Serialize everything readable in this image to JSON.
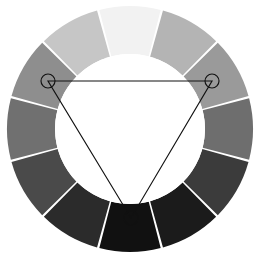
{
  "figure": {
    "background_color": "#ffffff"
  },
  "chart_data": {
    "type": "pie",
    "subtitle": "",
    "xlabel": "",
    "ylabel": "",
    "legend_position": "none",
    "grid": false,
    "geometry": {
      "center_x": 130,
      "center_y": 129,
      "outer_radius": 123,
      "inner_radius": 75,
      "segment_count": 12,
      "segment_arc_degrees": 30,
      "start_angle_degrees": -105,
      "gap_degrees": 1.1
    },
    "categories": [
      "segment-1-top",
      "segment-2",
      "segment-3",
      "segment-4",
      "segment-5",
      "segment-6-bottom",
      "segment-7",
      "segment-8",
      "segment-9",
      "segment-10",
      "segment-11",
      "segment-12"
    ],
    "values": [
      30,
      30,
      30,
      30,
      30,
      30,
      30,
      30,
      30,
      30,
      30,
      30
    ],
    "colors": [
      "#f2f2f2",
      "#b4b4b4",
      "#9a9a9a",
      "#6e6e6e",
      "#3b3b3b",
      "#1b1b1b",
      "#111111",
      "#2b2b2b",
      "#4a4a4a",
      "#707070",
      "#8e8e8e",
      "#c6c6c6"
    ],
    "segment_labels": [
      "lightest",
      "light gray",
      "mid light gray",
      "mid gray",
      "dark gray",
      "very dark gray",
      "near black",
      "very dark gray",
      "dark gray",
      "mid gray",
      "mid light gray",
      "light gray"
    ],
    "annotations": {
      "shape": "triangle",
      "shape_label": "triad harmony triangle",
      "stroke_color": "#111111",
      "vertices": [
        {
          "name": "vertex-left",
          "x": 48,
          "y": 81,
          "marker": "circle",
          "marker_radius": 7
        },
        {
          "name": "vertex-right",
          "x": 212,
          "y": 81,
          "marker": "circle",
          "marker_radius": 7
        },
        {
          "name": "vertex-bottom",
          "x": 131,
          "y": 218,
          "marker": "circle",
          "marker_radius": 7
        }
      ]
    }
  }
}
